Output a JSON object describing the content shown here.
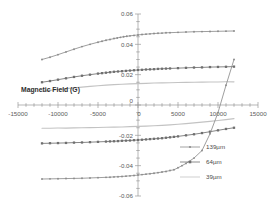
{
  "chart_data": {
    "type": "line",
    "title": "",
    "xlabel": "",
    "ylabel": "Magnetic Field (G)",
    "axis_title": "Magnetic Field (G)",
    "xlim": [
      -15000,
      15000
    ],
    "ylim": [
      -0.06,
      0.06
    ],
    "xticks": [
      -15000,
      -10000,
      -5000,
      0,
      5000,
      10000,
      15000
    ],
    "xtick_labels": [
      "-15000",
      "-10000",
      "-5000",
      "0",
      "5000",
      "10000",
      "15000"
    ],
    "yticks": [
      -0.06,
      -0.04,
      -0.02,
      0,
      0.02,
      0.04,
      0.06
    ],
    "ytick_labels": [
      "-0.06",
      "-0.04",
      "-0.02",
      "0",
      "0.02",
      "0.04",
      "0.06"
    ],
    "x_minor_tick_step": 1000,
    "y_minor_tick_step": 0.005,
    "grid": false,
    "legend_position": "right",
    "x_axis_crosses_y_at": 0,
    "series": [
      {
        "name": "139µm",
        "color": "#8c8c8c",
        "marker": "small-circle",
        "saturation": 0.048,
        "coercivity": 2400,
        "upper_branch_x": [
          -12000,
          -11000,
          -10000,
          -9000,
          -8000,
          -7000,
          -6000,
          -5000,
          -4500,
          -4000,
          -3500,
          -3000,
          -2600,
          -2200,
          -1800,
          -1400,
          -1000,
          -500,
          0,
          500,
          1000,
          1500,
          2000,
          2500,
          3000,
          3500,
          4000,
          5000,
          6000,
          7000,
          8000,
          9000,
          10000,
          11000,
          12000
        ],
        "upper_branch_y": [
          0.03,
          0.0315,
          0.0332,
          0.035,
          0.0368,
          0.0385,
          0.04,
          0.0414,
          0.042,
          0.0427,
          0.0432,
          0.0438,
          0.0442,
          0.0446,
          0.045,
          0.0453,
          0.0456,
          0.0459,
          0.0462,
          0.0465,
          0.0467,
          0.0469,
          0.0471,
          0.0473,
          0.0474,
          0.0476,
          0.0477,
          0.0479,
          0.0481,
          0.0483,
          0.0484,
          0.0485,
          0.0486,
          0.0487,
          0.0488
        ],
        "lower_branch_x": [
          -12000,
          -11000,
          -10000,
          -9000,
          -8000,
          -7000,
          -6000,
          -5000,
          -4000,
          -3500,
          -3000,
          -2500,
          -2000,
          -1500,
          -1000,
          -500,
          0,
          500,
          1000,
          1500,
          2000,
          2500,
          3000,
          3500,
          4000,
          4500,
          5000,
          5500,
          6000,
          7000,
          8000,
          9000,
          10000,
          11000,
          12000
        ],
        "lower_branch_y": [
          -0.0488,
          -0.0487,
          -0.0486,
          -0.0485,
          -0.0484,
          -0.0483,
          -0.0481,
          -0.0479,
          -0.0477,
          -0.0476,
          -0.0474,
          -0.0473,
          -0.0471,
          -0.0469,
          -0.0467,
          -0.0465,
          -0.0462,
          -0.0459,
          -0.0456,
          -0.0453,
          -0.045,
          -0.0446,
          -0.0442,
          -0.0438,
          -0.0432,
          -0.0427,
          -0.0414,
          -0.04,
          -0.0385,
          -0.035,
          -0.03,
          -0.019,
          -0.005,
          0.013,
          0.03
        ]
      },
      {
        "name": "64µm",
        "color": "#6f6f6f",
        "marker": "square",
        "saturation": 0.0253,
        "coercivity": 1300,
        "upper_branch_x": [
          -12000,
          -11000,
          -10000,
          -9000,
          -8000,
          -7000,
          -6000,
          -5000,
          -4500,
          -4000,
          -3500,
          -3000,
          -2500,
          -2000,
          -1500,
          -1000,
          -500,
          0,
          500,
          1000,
          1500,
          2000,
          2500,
          3000,
          3500,
          4000,
          5000,
          6000,
          7000,
          8000,
          9000,
          10000,
          11000,
          12000
        ],
        "upper_branch_y": [
          0.015,
          0.0158,
          0.0167,
          0.0176,
          0.0185,
          0.0193,
          0.02,
          0.0207,
          0.021,
          0.0213,
          0.0216,
          0.0219,
          0.0221,
          0.0223,
          0.0225,
          0.0227,
          0.0229,
          0.0231,
          0.0232,
          0.0234,
          0.0235,
          0.0236,
          0.0238,
          0.0239,
          0.024,
          0.0241,
          0.0243,
          0.0245,
          0.0247,
          0.0248,
          0.025,
          0.0251,
          0.0252,
          0.0253
        ],
        "lower_branch_x": [
          -12000,
          -11000,
          -10000,
          -9000,
          -8000,
          -7000,
          -6000,
          -5000,
          -4000,
          -3500,
          -3000,
          -2500,
          -2000,
          -1500,
          -1000,
          -500,
          0,
          500,
          1000,
          1500,
          2000,
          2500,
          3000,
          3500,
          4000,
          4500,
          5000,
          6000,
          7000,
          8000,
          9000,
          10000,
          11000,
          12000
        ],
        "lower_branch_y": [
          -0.0253,
          -0.0252,
          -0.0251,
          -0.025,
          -0.0248,
          -0.0247,
          -0.0245,
          -0.0243,
          -0.0241,
          -0.024,
          -0.0239,
          -0.0238,
          -0.0236,
          -0.0235,
          -0.0234,
          -0.0232,
          -0.0231,
          -0.0229,
          -0.0227,
          -0.0225,
          -0.0223,
          -0.0221,
          -0.0219,
          -0.0216,
          -0.0213,
          -0.021,
          -0.0207,
          -0.02,
          -0.0193,
          -0.0185,
          -0.0176,
          -0.0167,
          -0.0158,
          -0.015
        ]
      },
      {
        "name": "39µm",
        "color": "#c3c3c3",
        "marker": "none",
        "saturation": 0.0153,
        "coercivity": 700,
        "upper_branch_x": [
          -12000,
          -11000,
          -10000,
          -9000,
          -8000,
          -7000,
          -6000,
          -5000,
          -4000,
          -3000,
          -2000,
          -1000,
          0,
          1000,
          2000,
          3000,
          4000,
          5000,
          6000,
          7000,
          8000,
          9000,
          10000,
          11000,
          12000
        ],
        "upper_branch_y": [
          0.009,
          0.0096,
          0.0102,
          0.0108,
          0.0113,
          0.0118,
          0.0123,
          0.0127,
          0.0131,
          0.0134,
          0.0137,
          0.0139,
          0.0141,
          0.0143,
          0.0145,
          0.0146,
          0.0147,
          0.0148,
          0.0149,
          0.015,
          0.0151,
          0.0152,
          0.0152,
          0.0153,
          0.0153
        ],
        "lower_branch_x": [
          -12000,
          -11000,
          -10000,
          -9000,
          -8000,
          -7000,
          -6000,
          -5000,
          -4000,
          -3000,
          -2000,
          -1000,
          0,
          1000,
          2000,
          3000,
          4000,
          5000,
          6000,
          7000,
          8000,
          9000,
          10000,
          11000,
          12000
        ],
        "lower_branch_y": [
          -0.0153,
          -0.0153,
          -0.0152,
          -0.0152,
          -0.0151,
          -0.015,
          -0.0149,
          -0.0148,
          -0.0147,
          -0.0146,
          -0.0145,
          -0.0143,
          -0.0141,
          -0.0139,
          -0.0137,
          -0.0134,
          -0.0131,
          -0.0127,
          -0.0123,
          -0.0118,
          -0.0113,
          -0.0108,
          -0.0102,
          -0.0096,
          -0.009
        ]
      }
    ]
  },
  "legend": {
    "items": [
      {
        "label": "139µm",
        "color": "#8c8c8c",
        "marker": "small-circle"
      },
      {
        "label": "64µm",
        "color": "#6f6f6f",
        "marker": "square"
      },
      {
        "label": "39µm",
        "color": "#c3c3c3",
        "marker": "none"
      }
    ]
  }
}
